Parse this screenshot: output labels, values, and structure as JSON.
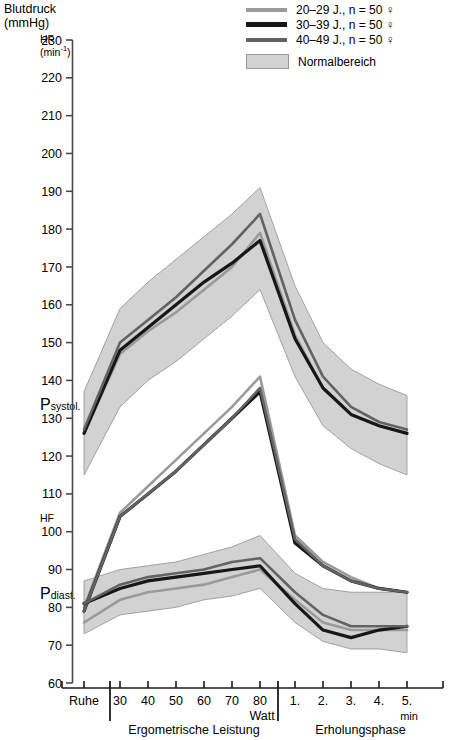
{
  "axis_titles": {
    "y_primary_line1": "Blutdruck",
    "y_primary_line2": "(mmHg)",
    "y_secondary_line1": "HF",
    "y_secondary_line2": "(min",
    "y_secondary_sup": "-1",
    "y_secondary_close": ")",
    "hf_inline": "HF"
  },
  "curve_labels": {
    "systolic_main": "P",
    "systolic_sub": "systol.",
    "diastolic_main": "P",
    "diastolic_sub": "diast."
  },
  "legend": {
    "items": [
      {
        "label": "20–29 J., n = 50 ♀",
        "color": "#9a9a9a",
        "key": "a20_29"
      },
      {
        "label": "30–39 J., n = 50 ♀",
        "color": "#171717",
        "key": "a30_39"
      },
      {
        "label": "40–49 J., n = 50 ♀",
        "color": "#636363",
        "key": "a40_49"
      }
    ],
    "band": {
      "label": "Normalbereich",
      "fill": "#d2d2d2",
      "stroke": "#9a9a9a"
    }
  },
  "x_axis": {
    "phase1_label": "Ergometrische Leistung",
    "phase2_label": "Erholungsphase",
    "unit_watt": "Watt",
    "unit_min": "min",
    "tick_labels": [
      "Ruhe",
      "30",
      "40",
      "50",
      "60",
      "70",
      "80",
      "1.",
      "2.",
      "3.",
      "4.",
      "5."
    ]
  },
  "chart_data": {
    "type": "line",
    "title": "Blutdruck (mmHg)",
    "xlabel": "Ergometrische Leistung / Erholungsphase",
    "ylabel": "Blutdruck (mmHg)",
    "ylim": [
      60,
      230
    ],
    "ytick_step": 10,
    "yticks": [
      230,
      220,
      210,
      200,
      190,
      180,
      170,
      160,
      150,
      140,
      130,
      120,
      110,
      100,
      90,
      80,
      70,
      60
    ],
    "grid": false,
    "legend_position": "top-right",
    "x": [
      "Ruhe",
      "30",
      "40",
      "50",
      "60",
      "70",
      "80",
      "1.",
      "2.",
      "3.",
      "4.",
      "5."
    ],
    "groups": [
      {
        "name": "P systol.",
        "band": {
          "upper": [
            137,
            159,
            166,
            172,
            178,
            184,
            191,
            165,
            150,
            143,
            139,
            136
          ],
          "lower": [
            115,
            133,
            140,
            145,
            151,
            157,
            164,
            141,
            128,
            122,
            118,
            115
          ]
        },
        "series": [
          {
            "name": "20–29 J., n = 50 ♀",
            "color": "#9a9a9a",
            "values": [
              126,
              147,
              153,
              158,
              164,
              170,
              179,
              152,
              138,
              131,
              128,
              126
            ]
          },
          {
            "name": "30–39 J., n = 50 ♀",
            "color": "#171717",
            "values": [
              126,
              148,
              154,
              160,
              166,
              171,
              177,
              151,
              138,
              131,
              128,
              126
            ]
          },
          {
            "name": "40–49 J., n = 50 ♀",
            "color": "#636363",
            "values": [
              127,
              150,
              156,
              162,
              169,
              176,
              184,
              156,
              141,
              133,
              129,
              127
            ]
          }
        ]
      },
      {
        "name": "HF",
        "band": null,
        "series": [
          {
            "name": "20–29 J., n = 50 ♀",
            "color": "#9a9a9a",
            "values": [
              80,
              105,
              112,
              119,
              126,
              133,
              141,
              99,
              92,
              88,
              85,
              84
            ]
          },
          {
            "name": "30–39 J., n = 50 ♀",
            "color": "#171717",
            "values": [
              79,
              104,
              110,
              116,
              123,
              130,
              137,
              97,
              91,
              87,
              85,
              84
            ]
          },
          {
            "name": "40–49 J., n = 50 ♀",
            "color": "#636363",
            "values": [
              79,
              104,
              110,
              116,
              123,
              130,
              138,
              98,
              91,
              87,
              85,
              84
            ]
          }
        ]
      },
      {
        "name": "P diast.",
        "band": {
          "upper": [
            87,
            90,
            91,
            92,
            94,
            96,
            99,
            89,
            85,
            84,
            84,
            84
          ],
          "lower": [
            73,
            78,
            79,
            80,
            82,
            83,
            85,
            76,
            71,
            69,
            69,
            68
          ]
        },
        "series": [
          {
            "name": "20–29 J., n = 50 ♀",
            "color": "#9a9a9a",
            "values": [
              76,
              82,
              84,
              85,
              86,
              88,
              90,
              82,
              76,
              74,
              74,
              74
            ]
          },
          {
            "name": "30–39 J., n = 50 ♀",
            "color": "#171717",
            "values": [
              81,
              85,
              87,
              88,
              89,
              90,
              91,
              81,
              74,
              72,
              74,
              75
            ]
          },
          {
            "name": "40–49 J., n = 50 ♀",
            "color": "#636363",
            "values": [
              81,
              86,
              88,
              89,
              90,
              92,
              93,
              84,
              78,
              75,
              75,
              75
            ]
          }
        ]
      }
    ]
  }
}
